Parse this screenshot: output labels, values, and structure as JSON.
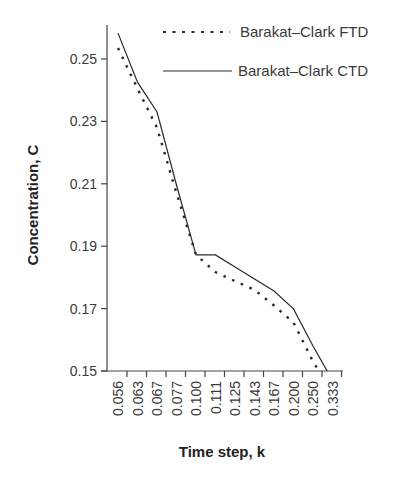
{
  "chart_data": {
    "type": "line",
    "title": "",
    "xlabel": "Time step, k",
    "ylabel": "Concentration, C",
    "categories": [
      "0.056",
      "0.063",
      "0.067",
      "0.077",
      "0.100",
      "0.111",
      "0.125",
      "0.143",
      "0.167",
      "0.200",
      "0.250",
      "0.333"
    ],
    "yticks": [
      "0.15",
      "0.17",
      "0.19",
      "0.21",
      "0.23",
      "0.25"
    ],
    "ylim": [
      0.15,
      0.26
    ],
    "grid": false,
    "legend_position": "top-right",
    "series": [
      {
        "name": "Barakat–Clark FTD",
        "style": "dotted",
        "values": [
          0.2535,
          0.2405,
          0.228,
          0.207,
          0.1872,
          0.1817,
          0.1788,
          0.176,
          0.171,
          0.1655,
          0.153,
          0.143
        ]
      },
      {
        "name": "Barakat–Clark CTD",
        "style": "solid",
        "values": [
          0.2583,
          0.2426,
          0.233,
          0.2096,
          0.1872,
          0.1872,
          0.1833,
          0.1795,
          0.1756,
          0.1699,
          0.158,
          0.147
        ]
      }
    ]
  },
  "legend": {
    "items": [
      {
        "label": "Barakat–Clark FTD",
        "style": "dotted"
      },
      {
        "label": "Barakat–Clark CTD",
        "style": "solid"
      }
    ]
  },
  "colors": {
    "line": "#2a2a2a",
    "axis": "#444444",
    "text": "#3a3a3a"
  }
}
